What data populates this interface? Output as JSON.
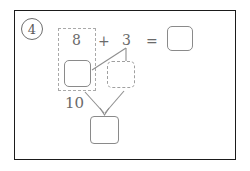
{
  "worksheet": {
    "problem_number": "4",
    "equation": {
      "addend_left": "8",
      "operator_plus": "+",
      "addend_right": "3",
      "operator_equals": "=",
      "answer_value": ""
    },
    "decomposition": {
      "ten_label": "10",
      "left_part_value": "",
      "right_part_value": "",
      "total_value": ""
    }
  },
  "colors": {
    "frame": "#1b1b1b",
    "ink": "#6a6a6a",
    "box_stroke": "#8a8a8a",
    "dashed_stroke": "#a0a0a0",
    "connector": "#8f8f8f",
    "paper": "#ffffff"
  }
}
